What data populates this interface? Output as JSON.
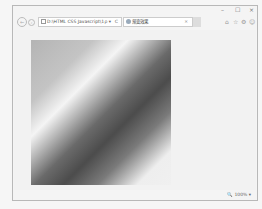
{
  "window": {
    "controls": {
      "minimize": "–",
      "maximize": "☐",
      "close": "×"
    }
  },
  "nav": {
    "back_icon": "←",
    "forward_icon": "›",
    "address": "D:\\HTML CSS Javascript\\1",
    "search_icon": "ρ ▾",
    "refresh_icon": "C"
  },
  "tab": {
    "title": "渐变效果",
    "close": "×"
  },
  "toolbar": {
    "home_icon": "⌂",
    "favorites_icon": "☆",
    "settings_icon": "⚙",
    "feedback_icon": "☺"
  },
  "content": {
    "gradient": {
      "direction": "135deg",
      "colors": [
        "#b4b4b4",
        "#f4f4f4",
        "#4c4c4c",
        "#eeeeee"
      ]
    }
  },
  "status": {
    "zoom": "🔍 100%  ▾"
  }
}
